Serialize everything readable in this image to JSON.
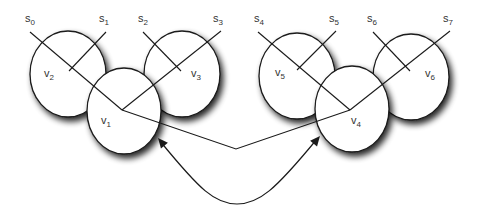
{
  "diagram": {
    "type": "tree-of-circles",
    "colors": {
      "stroke": "#1a1a1a",
      "fill": "#ffffff",
      "shadow": "#000000",
      "text": "#333333"
    },
    "leaves": [
      {
        "id": "s0",
        "base": "s",
        "sub": "0",
        "x": 25,
        "y": 22
      },
      {
        "id": "s1",
        "base": "s",
        "sub": "1",
        "x": 99,
        "y": 22
      },
      {
        "id": "s2",
        "base": "s",
        "sub": "2",
        "x": 138,
        "y": 22
      },
      {
        "id": "s3",
        "base": "s",
        "sub": "3",
        "x": 213,
        "y": 22
      },
      {
        "id": "s4",
        "base": "s",
        "sub": "4",
        "x": 254,
        "y": 22
      },
      {
        "id": "s5",
        "base": "s",
        "sub": "5",
        "x": 329,
        "y": 22
      },
      {
        "id": "s6",
        "base": "s",
        "sub": "6",
        "x": 367,
        "y": 22
      },
      {
        "id": "s7",
        "base": "s",
        "sub": "7",
        "x": 443,
        "y": 22
      }
    ],
    "nodes": [
      {
        "id": "v2",
        "base": "v",
        "sub": "2",
        "cx": 68,
        "cy": 74,
        "rx": 38,
        "ry": 43,
        "lx": 44,
        "ly": 77
      },
      {
        "id": "v3",
        "base": "v",
        "sub": "3",
        "cx": 182,
        "cy": 74,
        "rx": 38,
        "ry": 43,
        "lx": 191,
        "ly": 77
      },
      {
        "id": "v1",
        "base": "v",
        "sub": "1",
        "cx": 124,
        "cy": 111,
        "rx": 37,
        "ry": 43,
        "lx": 101,
        "ly": 124
      },
      {
        "id": "v5",
        "base": "v",
        "sub": "5",
        "cx": 297,
        "cy": 76,
        "rx": 38,
        "ry": 43,
        "lx": 275,
        "ly": 76
      },
      {
        "id": "v6",
        "base": "v",
        "sub": "6",
        "cx": 411,
        "cy": 77,
        "rx": 38,
        "ry": 43,
        "lx": 425,
        "ly": 77
      },
      {
        "id": "v4",
        "base": "v",
        "sub": "4",
        "cx": 352,
        "cy": 109,
        "rx": 37,
        "ry": 43,
        "lx": 351,
        "ly": 124
      }
    ],
    "edges": [
      {
        "from": "s0",
        "x1": 30,
        "y1": 32,
        "x2": 122,
        "y2": 110
      },
      {
        "from": "s1",
        "x1": 106,
        "y1": 32,
        "x2": 69,
        "y2": 71
      },
      {
        "from": "s2",
        "x1": 143,
        "y1": 32,
        "x2": 181,
        "y2": 71
      },
      {
        "from": "s3",
        "x1": 221,
        "y1": 31,
        "x2": 122,
        "y2": 110
      },
      {
        "from": "s4",
        "x1": 258,
        "y1": 32,
        "x2": 350,
        "y2": 110
      },
      {
        "from": "s5",
        "x1": 336,
        "y1": 31,
        "x2": 297,
        "y2": 70
      },
      {
        "from": "s6",
        "x1": 373,
        "y1": 32,
        "x2": 410,
        "y2": 71
      },
      {
        "from": "s7",
        "x1": 450,
        "y1": 31,
        "x2": 350,
        "y2": 110
      }
    ],
    "junction_link": {
      "points": "122,110 236,149 350,110"
    },
    "curved_arrow": {
      "path": "M 160 141 C 200 190, 215 204, 237 204 C 259 204, 275 190, 317 139",
      "arrow_left": {
        "tip": [
          158,
          138
        ],
        "angle": -130
      },
      "arrow_right": {
        "tip": [
          320,
          136
        ],
        "angle": -50
      }
    }
  }
}
